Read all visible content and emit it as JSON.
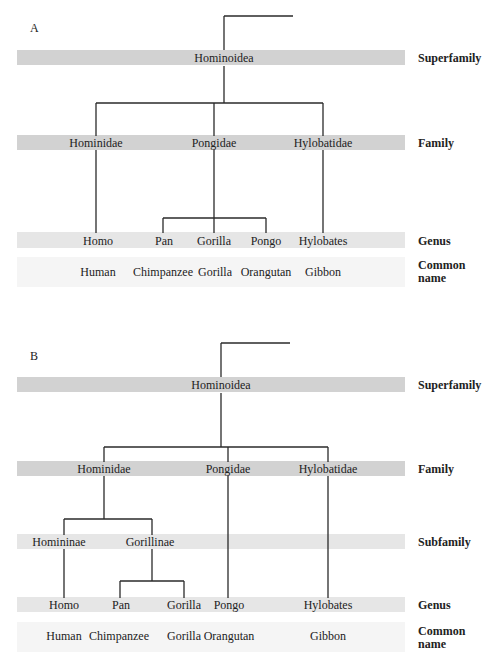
{
  "panels": [
    {
      "label": "A",
      "ranks": {
        "superfamily": "Superfamily",
        "family": "Family",
        "genus": "Genus",
        "common_name": "Common\nname"
      },
      "superfamily": "Hominoidea",
      "families": [
        "Hominidae",
        "Pongidae",
        "Hylobatidae"
      ],
      "genera": [
        "Homo",
        "Pan",
        "Gorilla",
        "Pongo",
        "Hylobates"
      ],
      "common_names": [
        "Human",
        "Chimpanzee",
        "Gorilla",
        "Orangutan",
        "Gibbon"
      ]
    },
    {
      "label": "B",
      "ranks": {
        "superfamily": "Superfamily",
        "family": "Family",
        "subfamily": "Subfamily",
        "genus": "Genus",
        "common_name": "Common\nname"
      },
      "superfamily": "Hominoidea",
      "families": [
        "Hominidae",
        "Pongidae",
        "Hylobatidae"
      ],
      "subfamilies": [
        "Homininae",
        "Gorillinae"
      ],
      "genera": [
        "Homo",
        "Pan",
        "Gorilla",
        "Pongo",
        "Hylobates"
      ],
      "common_names": [
        "Human",
        "Chimpanzee",
        "Gorilla",
        "Orangutan",
        "Gibbon"
      ]
    }
  ],
  "colors": {
    "band_dark": "#d2d2d2",
    "band_mid": "#e6e6e6",
    "band_light": "#f5f5f5",
    "line": "#2a2a2a"
  }
}
